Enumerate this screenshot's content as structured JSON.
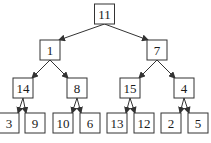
{
  "diagram": {
    "type": "binary-tree",
    "root": {
      "value": "11",
      "children": [
        {
          "value": "1",
          "children": [
            {
              "value": "14",
              "children": [
                {
                  "value": "3"
                },
                {
                  "value": "9"
                }
              ]
            },
            {
              "value": "8",
              "children": [
                {
                  "value": "10"
                },
                {
                  "value": "6"
                }
              ]
            }
          ]
        },
        {
          "value": "7",
          "children": [
            {
              "value": "15",
              "children": [
                {
                  "value": "13"
                },
                {
                  "value": "12"
                }
              ]
            },
            {
              "value": "4",
              "children": [
                {
                  "value": "2"
                },
                {
                  "value": "5"
                }
              ]
            }
          ]
        }
      ]
    },
    "edge_style": "arrow-to-child",
    "colors": {
      "stroke": "#333333",
      "fill": "#ffffff",
      "text": "#1a1a1a"
    }
  }
}
